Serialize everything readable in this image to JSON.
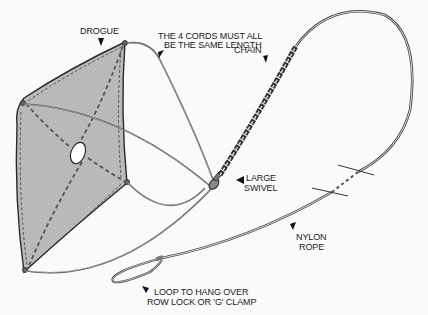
{
  "diagram": {
    "labels": {
      "drogue": "DROGUE",
      "cords_line1": "THE 4 CORDS MUST ALL",
      "cords_line2": "BE THE SAME LENGTH",
      "chain": "CHAIN",
      "swivel_line1": "LARGE",
      "swivel_line2": "SWIVEL",
      "rope_line1": "NYLON",
      "rope_line2": "ROPE",
      "loop_line1": "LOOP TO HANG OVER",
      "loop_line2": "ROW LOCK OR 'G' CLAMP"
    },
    "colors": {
      "fabric": "#b9b9b9",
      "outline": "#2a2a2a",
      "rope": "#555555",
      "background": "#fafafa"
    },
    "components": [
      "drogue",
      "4 cords",
      "large swivel",
      "chain",
      "nylon rope",
      "loop"
    ]
  }
}
